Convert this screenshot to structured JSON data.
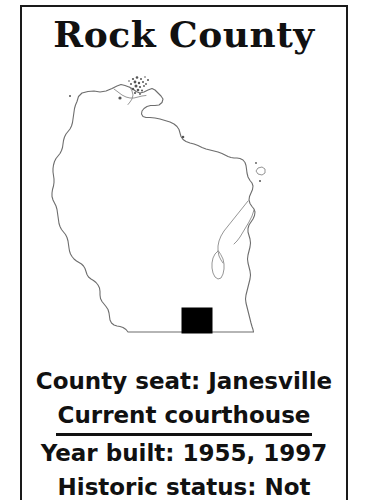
{
  "document": {
    "title": "Rock County",
    "type": "county-information-card"
  },
  "map": {
    "state": "Wisconsin",
    "highlighted_county": "Rock County",
    "highlight_color": "#000000",
    "outline_color": "#6d6d6d",
    "background": "#ffffff"
  },
  "info": {
    "county_seat_line": "County seat: Janesville",
    "section_heading": "Current courthouse",
    "year_built_line": "Year built: 1955, 1997",
    "historic_status_line": "Historic status: Not"
  }
}
